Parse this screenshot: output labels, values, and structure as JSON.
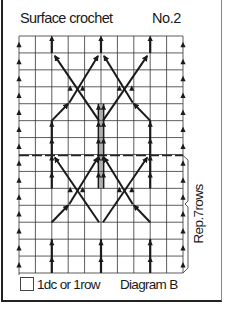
{
  "header": {
    "title": "Surface crochet",
    "number": "No.2"
  },
  "grid": {
    "columns": 10,
    "rows": 14,
    "x0": 19,
    "x1": 183,
    "y0": 36,
    "y1": 273,
    "repeat_divider_row": 7,
    "line_color": "#333333",
    "stitch_color": "#1a1a1a"
  },
  "repeat": {
    "label": "Rep.7rows",
    "rows": 7
  },
  "legend": {
    "symbol": "square",
    "text": "1dc or 1row",
    "diagram_label": "Diagram B"
  },
  "stitch_pattern": {
    "edge_columns": [
      0,
      10
    ],
    "vertical_columns": [
      2,
      5,
      8
    ],
    "center_column_doubled": true,
    "motif": "diamond lattice of diagonal surface-crochet arrows, two per half-repeat",
    "motif_rows_top": [
      2,
      3,
      4,
      5
    ],
    "motif_rows_bottom": [
      9,
      10,
      11,
      12
    ]
  }
}
